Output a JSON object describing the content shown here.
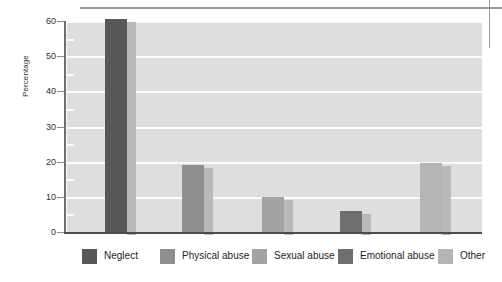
{
  "chart_data": {
    "type": "bar",
    "title": "",
    "xlabel": "",
    "ylabel": "Percentage",
    "ylim": [
      0,
      60
    ],
    "ytick_values": [
      0,
      10,
      20,
      30,
      40,
      50,
      60
    ],
    "ytick_labels": [
      "0",
      "10",
      "20",
      "30",
      "40",
      "50",
      "60"
    ],
    "minor_tick_values": [
      5,
      15,
      25,
      35,
      45,
      55
    ],
    "grid": true,
    "grid_axis": "y",
    "legend_position": "bottom",
    "categories": [
      "Neglect",
      "Physical abuse",
      "Sexual abuse",
      "Emotional abuse",
      "Other"
    ],
    "values": [
      60.5,
      19,
      10,
      6,
      19.5
    ],
    "series": [
      {
        "name": "Percentage",
        "values": [
          60.5,
          19,
          10,
          6,
          19.5
        ]
      }
    ],
    "bar_colors": [
      "#58585a",
      "#8f8f90",
      "#a3a3a4",
      "#6e6e70",
      "#b5b5b6"
    ],
    "bar_shadow_color": "#b9b9b7",
    "plot_background": "#dededc",
    "gridline_color": "#fbfbfa",
    "axis_color": "#4c4c4c"
  },
  "legend": {
    "items": [
      {
        "label": "Neglect",
        "color": "#58585a"
      },
      {
        "label": "Physical abuse",
        "color": "#8f8f90"
      },
      {
        "label": "Sexual abuse",
        "color": "#a3a3a4"
      },
      {
        "label": "Emotional abuse",
        "color": "#6e6e70"
      },
      {
        "label": "Other",
        "color": "#b5b5b6"
      }
    ]
  },
  "axis": {
    "y_title": "Percentage"
  }
}
